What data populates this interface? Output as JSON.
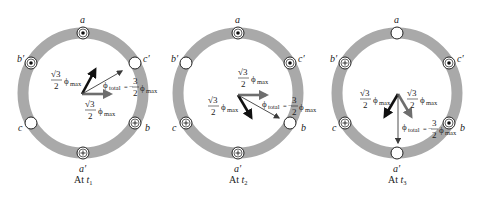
{
  "figure": {
    "colors": {
      "ring": "#a9a9a9",
      "arrow_dark": "#111111",
      "arrow_gray": "#6e6e6e",
      "arrow_thin": "#3a3a3a",
      "text": "#222222"
    },
    "flux_terms": {
      "sqrt3": "√3",
      "two": "2",
      "phi": "ϕ",
      "max": "max",
      "total": "total",
      "equals_neg": "= −",
      "three": "3"
    },
    "panels": [
      {
        "caption_prefix": "At ",
        "caption_t": "t",
        "caption_sub": "1",
        "slots": [
          {
            "label": "a",
            "symbol": "dot"
          },
          {
            "label": "c′",
            "symbol": "empty"
          },
          {
            "label": "b",
            "symbol": "cross"
          },
          {
            "label": "a′",
            "symbol": "cross"
          },
          {
            "label": "c",
            "symbol": "empty"
          },
          {
            "label": "b′",
            "symbol": "dot"
          }
        ],
        "vectors": [
          {
            "name": "phi-a-component",
            "label": "√3/2 ϕmax",
            "angle_deg": 60,
            "style": "dark"
          },
          {
            "name": "phi-b-component",
            "label": "√3/2 ϕmax",
            "angle_deg": 0,
            "style": "gray"
          },
          {
            "name": "phi-total",
            "label": "ϕtotal = −3/2 ϕmax",
            "angle_deg": 30,
            "style": "thin"
          }
        ]
      },
      {
        "caption_prefix": "At ",
        "caption_t": "t",
        "caption_sub": "2",
        "slots": [
          {
            "label": "a",
            "symbol": "dot"
          },
          {
            "label": "c′",
            "symbol": "dot"
          },
          {
            "label": "b",
            "symbol": "empty"
          },
          {
            "label": "a′",
            "symbol": "cross"
          },
          {
            "label": "c",
            "symbol": "cross"
          },
          {
            "label": "b′",
            "symbol": "empty"
          }
        ],
        "vectors": [
          {
            "name": "phi-a-component",
            "label": "√3/2 ϕmax",
            "angle_deg": -60,
            "style": "dark"
          },
          {
            "name": "phi-c-component",
            "label": "√3/2 ϕmax",
            "angle_deg": 0,
            "style": "gray"
          },
          {
            "name": "phi-total",
            "label": "ϕtotal = −3/2 ϕmax",
            "angle_deg": -30,
            "style": "thin"
          }
        ]
      },
      {
        "caption_prefix": "At ",
        "caption_t": "t",
        "caption_sub": "3",
        "slots": [
          {
            "label": "a",
            "symbol": "empty"
          },
          {
            "label": "c′",
            "symbol": "dot"
          },
          {
            "label": "b",
            "symbol": "dot"
          },
          {
            "label": "a′",
            "symbol": "empty"
          },
          {
            "label": "c",
            "symbol": "cross"
          },
          {
            "label": "b′",
            "symbol": "cross"
          }
        ],
        "vectors": [
          {
            "name": "phi-b-component",
            "label": "√3/2 ϕmax",
            "angle_deg": -120,
            "style": "dark"
          },
          {
            "name": "phi-c-component",
            "label": "√3/2 ϕmax",
            "angle_deg": -60,
            "style": "gray"
          },
          {
            "name": "phi-total",
            "label": "ϕtotal = −3/2 ϕmax",
            "angle_deg": -90,
            "style": "thin"
          }
        ]
      }
    ]
  }
}
